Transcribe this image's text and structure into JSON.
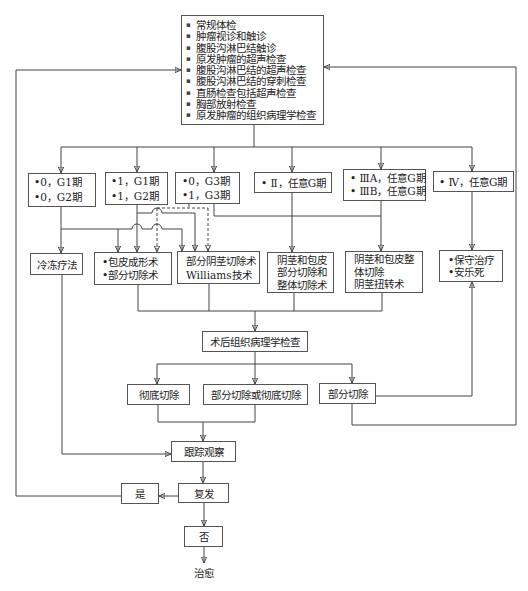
{
  "exam_box": {
    "bullet": "▪",
    "items": [
      "常规体检",
      "肿瘤视诊和触诊",
      "腹股沟淋巴结触诊",
      "原发肿瘤的超声检查",
      "腹股沟淋巴结的超声检查",
      "腹股沟淋巴结的穿刺检查",
      "直肠检查包括超声检查",
      "胸部放射检查",
      "原发肿瘤的组织病理学检查"
    ]
  },
  "stages": [
    {
      "lines": [
        "•0，G1期",
        "•0，G2期"
      ]
    },
    {
      "lines": [
        "•1，G1期",
        "•1，G2期"
      ]
    },
    {
      "lines": [
        "•0，G3期",
        "•1，G3期"
      ]
    },
    {
      "lines": [
        "• Ⅱ，任意G期"
      ]
    },
    {
      "lines": [
        "• ⅢA，任意G期",
        "• ⅢB，任意G期"
      ]
    },
    {
      "lines": [
        "• Ⅳ，任意G期"
      ]
    }
  ],
  "treatments": [
    {
      "lines": [
        "冷冻疗法"
      ]
    },
    {
      "lines": [
        "•包皮成形术",
        "•部分切除术"
      ]
    },
    {
      "lines": [
        "部分阴茎切除术",
        "Williams技术"
      ]
    },
    {
      "lines": [
        "阴茎和包皮",
        "部分切除和",
        "整体切除术"
      ]
    },
    {
      "lines": [
        "阴茎和包皮整",
        "体切除",
        "阴茎扭转术"
      ]
    },
    {
      "lines": [
        "•保守治疗",
        "•安乐死"
      ]
    }
  ],
  "pathology": {
    "label": "术后组织病理学检查"
  },
  "resection_results": [
    {
      "label": "彻底切除"
    },
    {
      "label": "部分切除或彻底切除"
    },
    {
      "label": "部分切除"
    }
  ],
  "follow_up": {
    "label": "跟踪观察"
  },
  "recurrence": {
    "label": "复发"
  },
  "recurrence_yes": {
    "label": "是"
  },
  "recurrence_no": {
    "label": "否"
  },
  "outcome": {
    "label": "治愈"
  },
  "edges": [
    {
      "from": "exam_box",
      "to": "stages.0",
      "style": "solid"
    },
    {
      "from": "exam_box",
      "to": "stages.1",
      "style": "solid"
    },
    {
      "from": "exam_box",
      "to": "stages.2",
      "style": "solid"
    },
    {
      "from": "exam_box",
      "to": "stages.3",
      "style": "solid"
    },
    {
      "from": "exam_box",
      "to": "stages.4",
      "style": "solid"
    },
    {
      "from": "exam_box",
      "to": "stages.5",
      "style": "solid"
    },
    {
      "from": "stages.0",
      "to": "treatments.0",
      "style": "solid"
    },
    {
      "from": "stages.0",
      "to": "treatments.1",
      "style": "solid"
    },
    {
      "from": "stages.0",
      "to": "treatments.2",
      "style": "solid"
    },
    {
      "from": "stages.1",
      "to": "treatments.1",
      "style": "solid"
    },
    {
      "from": "stages.1",
      "to": "treatments.2",
      "style": "solid"
    },
    {
      "from": "stages.2",
      "to": "treatments.1",
      "style": "dashed"
    },
    {
      "from": "stages.2",
      "to": "treatments.2",
      "style": "dashed"
    },
    {
      "from": "stages.2",
      "to": "treatments.4",
      "style": "solid"
    },
    {
      "from": "stages.3",
      "to": "treatments.3",
      "style": "solid"
    },
    {
      "from": "stages.4",
      "to": "treatments.4",
      "style": "solid"
    },
    {
      "from": "stages.5",
      "to": "treatments.5",
      "style": "solid"
    },
    {
      "from": "treatments.1",
      "to": "pathology",
      "style": "solid"
    },
    {
      "from": "treatments.2",
      "to": "pathology",
      "style": "solid"
    },
    {
      "from": "treatments.3",
      "to": "pathology",
      "style": "solid"
    },
    {
      "from": "treatments.4",
      "to": "pathology",
      "style": "solid"
    },
    {
      "from": "pathology",
      "to": "resection_results.0",
      "style": "solid"
    },
    {
      "from": "pathology",
      "to": "resection_results.1",
      "style": "solid"
    },
    {
      "from": "pathology",
      "to": "resection_results.2",
      "style": "solid"
    },
    {
      "from": "resection_results.0",
      "to": "follow_up",
      "style": "solid"
    },
    {
      "from": "resection_results.1",
      "to": "follow_up",
      "style": "solid"
    },
    {
      "from": "resection_results.2",
      "to": "treatments.5",
      "style": "solid"
    },
    {
      "from": "resection_results.2",
      "to": "exam_box",
      "style": "solid"
    },
    {
      "from": "treatments.0",
      "to": "follow_up",
      "style": "solid"
    },
    {
      "from": "follow_up",
      "to": "recurrence",
      "style": "solid"
    },
    {
      "from": "recurrence",
      "to": "recurrence_yes",
      "style": "solid"
    },
    {
      "from": "recurrence_yes",
      "to": "exam_box",
      "style": "solid"
    },
    {
      "from": "recurrence",
      "to": "recurrence_no",
      "style": "solid"
    },
    {
      "from": "recurrence_no",
      "to": "outcome",
      "style": "solid"
    }
  ]
}
